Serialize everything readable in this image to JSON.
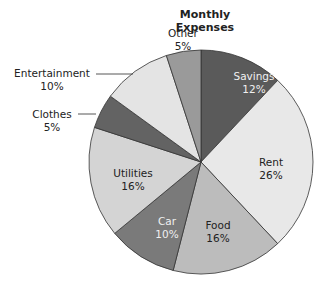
{
  "chart_data": {
    "type": "pie",
    "title": "Monthly Expenses",
    "categories": [
      "Savings",
      "Rent",
      "Food",
      "Car",
      "Utilities",
      "Clothes",
      "Entertainment",
      "Other"
    ],
    "values": [
      12,
      26,
      16,
      10,
      16,
      5,
      10,
      5
    ],
    "unit": "%",
    "start_angle": "12 o'clock, clockwise",
    "colors": [
      "#5a5a5a",
      "#e8e8e8",
      "#bcbcbc",
      "#7a7a7a",
      "#d4d4d4",
      "#636363",
      "#e4e4e4",
      "#9a9a9a"
    ],
    "labels": [
      {
        "name": "Savings",
        "pct": "12%",
        "inside": true
      },
      {
        "name": "Rent",
        "pct": "26%",
        "inside": true
      },
      {
        "name": "Food",
        "pct": "16%",
        "inside": true
      },
      {
        "name": "Car",
        "pct": "10%",
        "inside": true
      },
      {
        "name": "Utilities",
        "pct": "16%",
        "inside": true
      },
      {
        "name": "Clothes",
        "pct": "5%",
        "inside": false
      },
      {
        "name": "Entertainment",
        "pct": "10%",
        "inside": false
      },
      {
        "name": "Other",
        "pct": "5%",
        "inside": false
      }
    ],
    "legend": "none (labels on/next to slices)"
  }
}
